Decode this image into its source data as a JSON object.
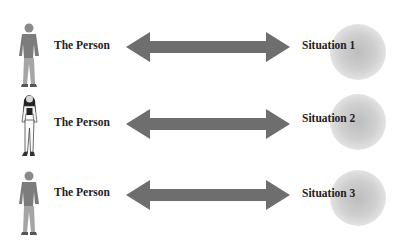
{
  "diagram": {
    "rows": [
      {
        "person_label": "The Person",
        "person_figure": "man-figure",
        "situation_label": "Situation 1"
      },
      {
        "person_label": "The Person",
        "person_figure": "woman-figure",
        "situation_label": "Situation 2"
      },
      {
        "person_label": "The Person",
        "person_figure": "man-figure",
        "situation_label": "Situation 3"
      }
    ],
    "connector": "double-headed-arrow",
    "colors": {
      "arrow": "#6e6e6e",
      "situation_blob": "#c4c4c4",
      "text": "#222222",
      "background": "#ffffff"
    }
  }
}
